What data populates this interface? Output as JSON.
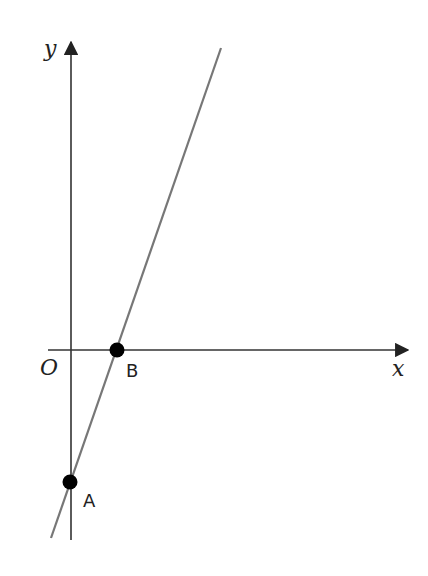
{
  "diagram": {
    "type": "coordinate-plane-line",
    "axes": {
      "x_label": "x",
      "y_label": "y",
      "origin_label": "O",
      "color": "#333333"
    },
    "line": {
      "color": "#777777",
      "description": "Straight line with positive slope crossing the negative y-axis at A and the positive x-axis at B"
    },
    "points": [
      {
        "label": "A",
        "location": "y-intercept (below origin)",
        "color": "#000000"
      },
      {
        "label": "B",
        "location": "x-intercept (right of origin)",
        "color": "#000000"
      }
    ]
  }
}
